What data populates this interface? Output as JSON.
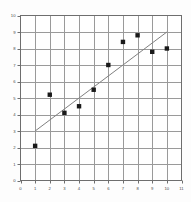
{
  "chart_data": {
    "type": "scatter",
    "title": "",
    "subtitle": "",
    "xlabel": "",
    "ylabel": "",
    "xlim": [
      0,
      11
    ],
    "ylim": [
      0,
      10
    ],
    "grid": true,
    "legend": null,
    "x_ticks": [
      0,
      1,
      2,
      3,
      4,
      5,
      6,
      7,
      8,
      9,
      10,
      11
    ],
    "y_ticks": [
      0,
      1,
      2,
      3,
      4,
      5,
      6,
      7,
      8,
      9,
      10
    ],
    "x_tick_labels": [
      "0",
      "1",
      "2",
      "3",
      "4",
      "5",
      "6",
      "7",
      "8",
      "9",
      "10",
      "11"
    ],
    "y_tick_labels": [
      "0",
      "1",
      "2",
      "3",
      "4",
      "5",
      "6",
      "7",
      "8",
      "9",
      "10"
    ],
    "series": [
      {
        "name": "data-points",
        "type": "scatter",
        "marker": "square",
        "color": "#1a1a1a",
        "x": [
          1,
          2,
          3,
          4,
          5,
          6,
          7,
          8,
          9,
          10
        ],
        "y": [
          2.1,
          5.2,
          4.1,
          4.5,
          5.5,
          7.0,
          8.4,
          8.8,
          7.8,
          8.0
        ],
        "points": [
          {
            "x": 1,
            "y": 2.1
          },
          {
            "x": 2,
            "y": 5.2
          },
          {
            "x": 3,
            "y": 4.1
          },
          {
            "x": 4,
            "y": 4.5
          },
          {
            "x": 5,
            "y": 5.5
          },
          {
            "x": 6,
            "y": 7.0
          },
          {
            "x": 7,
            "y": 8.4
          },
          {
            "x": 8,
            "y": 8.8
          },
          {
            "x": 9,
            "y": 7.8
          },
          {
            "x": 10,
            "y": 8.0
          }
        ]
      },
      {
        "name": "trend-line",
        "type": "line",
        "color": "#808080",
        "x": [
          1,
          10
        ],
        "y": [
          3.0,
          9.0
        ],
        "points": [
          {
            "x": 1,
            "y": 3.0
          },
          {
            "x": 10,
            "y": 9.0
          }
        ]
      }
    ],
    "colors": {
      "background": "#fdfdfd",
      "plot_background": "#ffffff",
      "gridline": "#9a9a9a",
      "axis": "#6e6e6e",
      "marker": "#1a1a1a",
      "trend_line": "#808080",
      "tick_label": "#4a4a4a"
    }
  }
}
